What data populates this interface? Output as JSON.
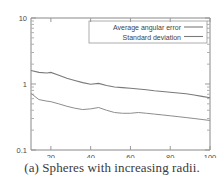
{
  "figure": {
    "caption": "(a) Spheres with increasing radii."
  },
  "chart_data": {
    "type": "line",
    "title": "",
    "xlabel": "",
    "ylabel": "",
    "yscale": "log",
    "xscale": "linear",
    "xlim": [
      10,
      100
    ],
    "ylim": [
      0.1,
      10
    ],
    "grid": false,
    "legend_position": "top-right",
    "xticks": [
      20,
      40,
      60,
      80,
      100
    ],
    "xticklabels": [
      "20",
      "40",
      "60",
      "80",
      "100"
    ],
    "yticks": [
      0.1,
      1,
      10
    ],
    "yticklabels": [
      "0.1",
      "1",
      "10"
    ],
    "x": [
      10,
      14,
      18,
      20,
      24,
      28,
      32,
      36,
      40,
      44,
      48,
      52,
      56,
      60,
      64,
      68,
      72,
      76,
      80,
      84,
      88,
      92,
      96,
      100
    ],
    "series": [
      {
        "name": "Average angular error",
        "linestyle": "solid",
        "color": "#7a7a7a",
        "values": [
          1.6,
          1.5,
          1.47,
          1.5,
          1.36,
          1.22,
          1.13,
          1.05,
          0.99,
          1.02,
          0.95,
          0.9,
          0.88,
          0.86,
          0.84,
          0.82,
          0.79,
          0.77,
          0.75,
          0.73,
          0.71,
          0.68,
          0.65,
          0.62
        ]
      },
      {
        "name": "Standard deviation",
        "linestyle": "solid",
        "color": "#8d8d8d",
        "values": [
          0.72,
          0.58,
          0.55,
          0.54,
          0.5,
          0.46,
          0.43,
          0.41,
          0.42,
          0.44,
          0.4,
          0.37,
          0.36,
          0.36,
          0.37,
          0.36,
          0.35,
          0.34,
          0.33,
          0.32,
          0.31,
          0.3,
          0.29,
          0.28
        ]
      }
    ],
    "legend": [
      "Average angular error",
      "Standard deviation"
    ]
  }
}
